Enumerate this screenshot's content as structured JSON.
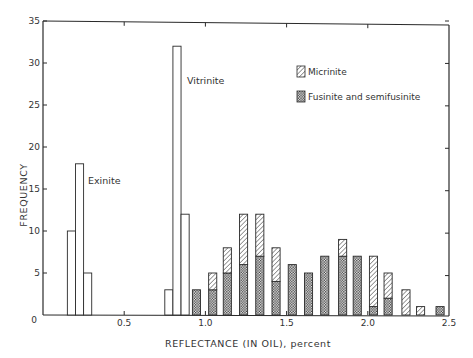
{
  "chart_data": {
    "type": "bar",
    "subtype": "stacked-histogram",
    "title": "",
    "xlabel": "REFLECTANCE (IN OIL), percent",
    "ylabel": "FREQUENCY",
    "xlim": [
      0,
      2.5
    ],
    "ylim": [
      0,
      35
    ],
    "xticks": [
      0,
      0.5,
      1.0,
      1.5,
      2.0,
      2.5
    ],
    "xtick_labels": [
      "0",
      "0.5",
      "1.0",
      "1.5",
      "2.0",
      "2.5"
    ],
    "yticks": [
      0,
      5,
      10,
      15,
      20,
      25,
      30,
      35
    ],
    "ytick_labels": [
      "0",
      "5",
      "10",
      "15",
      "20",
      "25",
      "30",
      "35"
    ],
    "grid": false,
    "bin_width": 0.05,
    "legend": {
      "position": "upper-right",
      "entries": [
        {
          "label": "Micrinite",
          "pattern": "diagonal-hatch"
        },
        {
          "label": "Fusinite and semifusinite",
          "pattern": "crosshatch"
        }
      ]
    },
    "series": [
      {
        "name": "Exinite",
        "pattern": "open",
        "annotation": "Exinite",
        "bins": [
          0.15,
          0.2,
          0.25
        ],
        "values": [
          10,
          18,
          5
        ]
      },
      {
        "name": "Vitrinite",
        "pattern": "open",
        "annotation": "Vitrinite",
        "bins": [
          0.75,
          0.8,
          0.85
        ],
        "values": [
          3,
          32,
          12
        ]
      },
      {
        "name": "Fusinite and semifusinite",
        "pattern": "crosshatch",
        "bins": [
          0.92,
          1.02,
          1.11,
          1.21,
          1.31,
          1.41,
          1.51,
          1.61,
          1.71,
          1.82,
          1.91,
          2.01,
          2.1,
          2.21,
          2.3,
          2.42
        ],
        "values": [
          3,
          3,
          5,
          6,
          7,
          4,
          6,
          5,
          7,
          7,
          7,
          1,
          2,
          0,
          0,
          1
        ]
      },
      {
        "name": "Micrinite",
        "pattern": "diagonal-hatch",
        "stacked_on": "Fusinite and semifusinite",
        "bins": [
          0.92,
          1.02,
          1.11,
          1.21,
          1.31,
          1.41,
          1.51,
          1.61,
          1.71,
          1.82,
          1.91,
          2.01,
          2.1,
          2.21,
          2.3,
          2.42
        ],
        "values": [
          0,
          2,
          3,
          6,
          5,
          4,
          0,
          0,
          0,
          2,
          0,
          6,
          3,
          3,
          1,
          0
        ]
      }
    ]
  },
  "labels": {
    "ylabel": "FREQUENCY",
    "xlabel": "REFLECTANCE (IN OIL), percent",
    "exinite": "Exinite",
    "vitrinite": "Vitrinite",
    "legend_micrinite": "Micrinite",
    "legend_fusinite": "Fusinite and semifusinite"
  },
  "colors": {
    "ink": "#2a2a2a",
    "background": "#ffffff"
  }
}
